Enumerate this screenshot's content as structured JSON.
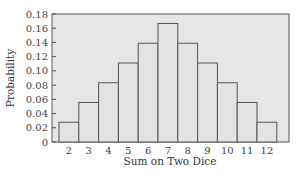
{
  "chart_data": {
    "type": "bar",
    "title": "",
    "xlabel": "Sum on Two Dice",
    "ylabel": "Probability",
    "categories": [
      "2",
      "3",
      "4",
      "5",
      "6",
      "7",
      "8",
      "9",
      "10",
      "11",
      "12"
    ],
    "values": [
      0.0278,
      0.0556,
      0.0833,
      0.1111,
      0.1389,
      0.1667,
      0.1389,
      0.1111,
      0.0833,
      0.0556,
      0.0278
    ],
    "ylim": [
      0,
      0.18
    ],
    "yticks": [
      "0",
      "0.02",
      "0.04",
      "0.06",
      "0.08",
      "0.10",
      "0.12",
      "0.14",
      "0.16",
      "0.18"
    ],
    "grid": false,
    "legend": null,
    "colors": {
      "plot_bg": "#e6e6e6",
      "bar_fill": "#e3e3e3",
      "bar_edge": "#555555",
      "frame": "#555555"
    }
  }
}
